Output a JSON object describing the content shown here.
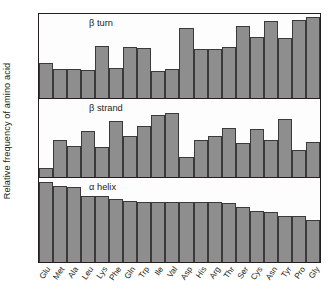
{
  "figure": {
    "ylabel": "Relative frequency of amino acid"
  },
  "chart_data": {
    "type": "bar",
    "title": "",
    "subtitle": "",
    "xlabel": "",
    "ylabel": "Relative frequency of amino acid",
    "grid": false,
    "legend": "none",
    "orientation": "vertical",
    "panel_layout": "3 stacked panels sharing one x axis",
    "ylim": [
      0,
      1
    ],
    "axis_ticks_y": "none (relative scale, unlabeled)",
    "categories": [
      "Glu",
      "Met",
      "Ala",
      "Leu",
      "Lys",
      "Phe",
      "Gln",
      "Trp",
      "Ile",
      "Val",
      "Asp",
      "His",
      "Arg",
      "Thr",
      "Ser",
      "Cys",
      "Asn",
      "Tyr",
      "Pro",
      "Gly"
    ],
    "panels": [
      {
        "name": "beta-turn",
        "label": "β turn",
        "values": [
          0.42,
          0.34,
          0.35,
          0.33,
          0.62,
          0.36,
          0.61,
          0.6,
          0.32,
          0.34,
          0.83,
          0.58,
          0.58,
          0.61,
          0.86,
          0.73,
          0.92,
          0.72,
          0.93,
          0.96
        ]
      },
      {
        "name": "beta-strand",
        "label": "β strand",
        "values": [
          0.11,
          0.47,
          0.4,
          0.59,
          0.39,
          0.72,
          0.52,
          0.66,
          0.79,
          0.82,
          0.26,
          0.48,
          0.52,
          0.63,
          0.44,
          0.62,
          0.48,
          0.75,
          0.34,
          0.45
        ]
      },
      {
        "name": "alpha-helix",
        "label": "α helix",
        "values": [
          0.95,
          0.91,
          0.89,
          0.79,
          0.78,
          0.75,
          0.73,
          0.72,
          0.72,
          0.72,
          0.71,
          0.71,
          0.71,
          0.7,
          0.66,
          0.61,
          0.59,
          0.55,
          0.55,
          0.5
        ]
      }
    ]
  }
}
